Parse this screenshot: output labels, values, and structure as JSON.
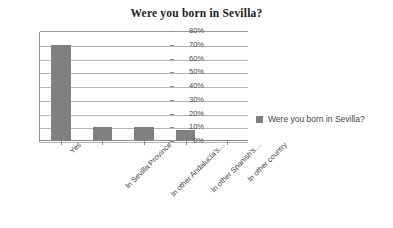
{
  "chart_data": {
    "type": "bar",
    "title": "Were you born in Sevilla?",
    "xlabel": "",
    "ylabel": "",
    "categories": [
      "Yes",
      "In Sevilla Province",
      "In other Andalucía's…",
      "In other Spanish's…",
      "In other country"
    ],
    "values": [
      70,
      10,
      10,
      8,
      1
    ],
    "ylim": [
      0,
      80
    ],
    "yticks": [
      0,
      10,
      20,
      30,
      40,
      50,
      60,
      70,
      80
    ],
    "ytick_labels": [
      "0%",
      "10%",
      "20%",
      "30%",
      "40%",
      "50%",
      "60%",
      "70%",
      "80%"
    ],
    "grid": true,
    "legend_position": "right",
    "legend": [
      {
        "name": "Were you born in Sevilla?",
        "color": "#808080"
      }
    ],
    "series": [
      {
        "name": "Were you born in Sevilla?",
        "color": "#808080",
        "values": [
          70,
          10,
          10,
          8,
          1
        ]
      }
    ]
  },
  "colors": {
    "bar": "#808080",
    "gridline": "#b5b5b5",
    "axis": "#8e8e8e",
    "background": "#ffffff",
    "title_text": "#1c1c1c",
    "label_text": "#3f3f3f"
  }
}
